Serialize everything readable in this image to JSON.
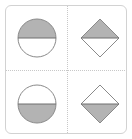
{
  "figure": {
    "layout": "2x2 grid",
    "colors": {
      "frame_border": "#d2d2d2",
      "divider": "#c8c8c8",
      "shape_stroke": "#8a8a8a",
      "fill": "#b3b3b3",
      "empty": "#ffffff"
    },
    "cells": [
      {
        "row": 0,
        "col": 0,
        "shape": "circle",
        "filled_half": "top"
      },
      {
        "row": 0,
        "col": 1,
        "shape": "diamond",
        "filled_half": "top"
      },
      {
        "row": 1,
        "col": 0,
        "shape": "circle",
        "filled_half": "bottom"
      },
      {
        "row": 1,
        "col": 1,
        "shape": "diamond",
        "filled_half": "bottom"
      }
    ]
  }
}
